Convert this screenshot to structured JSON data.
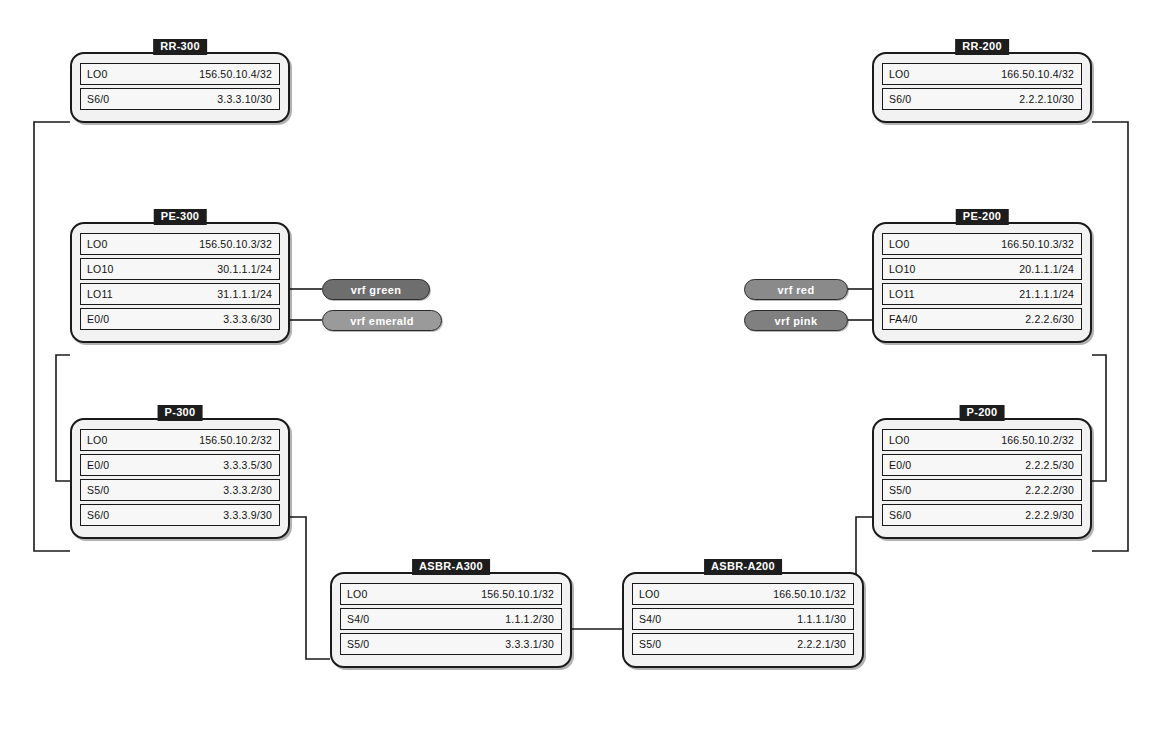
{
  "diagram": {
    "background_color": "#ffffff",
    "node_fill": "#f2f2f2",
    "node_border": "#1a1a1a",
    "title_bg": "#1d1d1d",
    "title_fg": "#ffffff",
    "link_color": "#1a1a1a"
  },
  "nodes": {
    "rr300": {
      "title": "RR-300",
      "rows": [
        {
          "iface": "LO0",
          "addr": "156.50.10.4/32"
        },
        {
          "iface": "S6/0",
          "addr": "3.3.3.10/30"
        }
      ]
    },
    "pe300": {
      "title": "PE-300",
      "rows": [
        {
          "iface": "LO0",
          "addr": "156.50.10.3/32"
        },
        {
          "iface": "LO10",
          "addr": "30.1.1.1/24"
        },
        {
          "iface": "LO11",
          "addr": "31.1.1.1/24"
        },
        {
          "iface": "E0/0",
          "addr": "3.3.3.6/30"
        }
      ]
    },
    "p300": {
      "title": "P-300",
      "rows": [
        {
          "iface": "LO0",
          "addr": "156.50.10.2/32"
        },
        {
          "iface": "E0/0",
          "addr": "3.3.3.5/30"
        },
        {
          "iface": "S5/0",
          "addr": "3.3.3.2/30"
        },
        {
          "iface": "S6/0",
          "addr": "3.3.3.9/30"
        }
      ]
    },
    "asbr_a300": {
      "title": "ASBR-A300",
      "rows": [
        {
          "iface": "LO0",
          "addr": "156.50.10.1/32"
        },
        {
          "iface": "S4/0",
          "addr": "1.1.1.2/30"
        },
        {
          "iface": "S5/0",
          "addr": "3.3.3.1/30"
        }
      ]
    },
    "rr200": {
      "title": "RR-200",
      "rows": [
        {
          "iface": "LO0",
          "addr": "166.50.10.4/32"
        },
        {
          "iface": "S6/0",
          "addr": "2.2.2.10/30"
        }
      ]
    },
    "pe200": {
      "title": "PE-200",
      "rows": [
        {
          "iface": "LO0",
          "addr": "166.50.10.3/32"
        },
        {
          "iface": "LO10",
          "addr": "20.1.1.1/24"
        },
        {
          "iface": "LO11",
          "addr": "21.1.1.1/24"
        },
        {
          "iface": "FA4/0",
          "addr": "2.2.2.6/30"
        }
      ]
    },
    "p200": {
      "title": "P-200",
      "rows": [
        {
          "iface": "LO0",
          "addr": "166.50.10.2/32"
        },
        {
          "iface": "E0/0",
          "addr": "2.2.2.5/30"
        },
        {
          "iface": "S5/0",
          "addr": "2.2.2.2/30"
        },
        {
          "iface": "S6/0",
          "addr": "2.2.2.9/30"
        }
      ]
    },
    "asbr_a200": {
      "title": "ASBR-A200",
      "rows": [
        {
          "iface": "LO0",
          "addr": "166.50.10.1/32"
        },
        {
          "iface": "S4/0",
          "addr": "1.1.1.1/30"
        },
        {
          "iface": "S5/0",
          "addr": "2.2.2.1/30"
        }
      ]
    }
  },
  "vrfs": [
    {
      "label": "vrf green",
      "color": "#6e6e6e"
    },
    {
      "label": "vrf emerald",
      "color": "#9a9a9a"
    },
    {
      "label": "vrf red",
      "color": "#8a8a8a"
    },
    {
      "label": "vrf pink",
      "color": "#808080"
    }
  ]
}
